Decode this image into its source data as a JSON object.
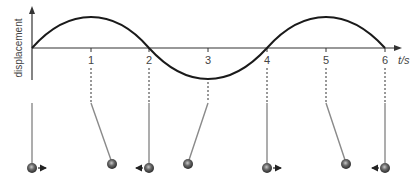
{
  "diagram": {
    "type": "displacement-time graph with pendulum positions",
    "y_axis_label": "displacement",
    "x_axis_label": "t/s",
    "x_ticks": [
      "1",
      "2",
      "3",
      "4",
      "5",
      "6"
    ],
    "curve": "sine wave, period 4 s, starts at 0 rising, peak at t=1, zero at t=2, trough at t=3, zero at t=4, peak at t=5, zero at t=6",
    "pendulums": [
      {
        "t": "0",
        "position": "centre",
        "motion": "moving right"
      },
      {
        "t": "1",
        "position": "right extreme",
        "motion": "momentarily at rest"
      },
      {
        "t": "2",
        "position": "centre",
        "motion": "moving left"
      },
      {
        "t": "3",
        "position": "left extreme",
        "motion": "momentarily at rest"
      },
      {
        "t": "4",
        "position": "centre",
        "motion": "moving right"
      },
      {
        "t": "5",
        "position": "right extreme",
        "motion": "momentarily at rest"
      },
      {
        "t": "6",
        "position": "centre",
        "motion": "moving left"
      }
    ],
    "colors": {
      "curve": "#1a1a1a",
      "axis": "#333333",
      "string": "#8a8a8a",
      "bob": "#555555"
    }
  }
}
